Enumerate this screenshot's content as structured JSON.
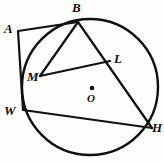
{
  "figure": {
    "type": "circle-geometry-diagram",
    "stroke_color": "#101010",
    "background_color": "#fdfdfc"
  },
  "circle": {
    "name": "main-circle",
    "center_x": 90,
    "center_y": 87,
    "radius": 68,
    "stroke_width": 2.4
  },
  "center_marker": {
    "name": "center-point-O",
    "x": 92,
    "y": 88,
    "radius": 2.3
  },
  "points": {
    "A": {
      "label": "A",
      "x": 18,
      "y": 31,
      "label_x": 4,
      "label_y": 22,
      "on_circle": false
    },
    "B": {
      "label": "B",
      "x": 78,
      "y": 22,
      "label_x": 72,
      "label_y": 1,
      "on_circle": true
    },
    "L": {
      "label": "L",
      "x": 110,
      "y": 61,
      "label_x": 114,
      "label_y": 52,
      "on_circle": true
    },
    "M": {
      "label": "M",
      "x": 40,
      "y": 76,
      "label_x": 27,
      "label_y": 70,
      "on_circle": true
    },
    "W": {
      "label": "W",
      "x": 23,
      "y": 110,
      "label_x": 4,
      "label_y": 104,
      "on_circle": true
    },
    "H": {
      "label": "H",
      "x": 152,
      "y": 128,
      "label_x": 152,
      "label_y": 121,
      "on_circle": true
    },
    "O": {
      "label": "O",
      "x": 92,
      "y": 88,
      "label_x": 87,
      "label_y": 93,
      "on_circle": false
    }
  },
  "segments": [
    {
      "name": "segment-A-B",
      "from": "A",
      "to": "B"
    },
    {
      "name": "segment-A-W",
      "from": "A",
      "to": "W"
    },
    {
      "name": "segment-B-M",
      "from": "B",
      "to": "M"
    },
    {
      "name": "segment-B-H",
      "from": "B",
      "to": "H"
    },
    {
      "name": "segment-M-L",
      "from": "M",
      "to": "L"
    },
    {
      "name": "segment-W-H",
      "from": "W",
      "to": "H"
    }
  ],
  "labels": {
    "A": "A",
    "B": "B",
    "L": "L",
    "M": "M",
    "W": "W",
    "H": "H",
    "O": "O"
  }
}
